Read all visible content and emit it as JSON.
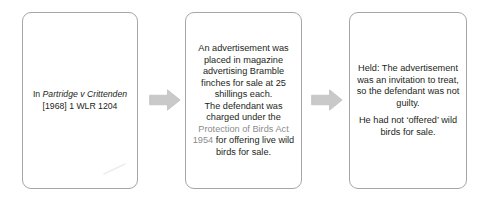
{
  "diagram": {
    "type": "flowchart",
    "orientation": "left-to-right",
    "steps": [
      {
        "id": "citation",
        "name": "case-citation-box",
        "lines": [
          {
            "prefix": "In ",
            "case_name": "Partridge v Crittenden",
            "suffix": ""
          },
          {
            "citation": "[1968] 1 WLR 1204"
          }
        ],
        "text_plain": "In Partridge v Crittenden\n[1968] 1 WLR 1204"
      },
      {
        "id": "facts",
        "name": "case-facts-box",
        "text_before_statute": "An advertisement was placed in magazine advertising Bramble finches for sale at 25 shillings each.\nThe defendant was charged under the ",
        "statute": "Protection of Birds Act 1954",
        "text_after_statute": " for offering live wild birds for sale."
      },
      {
        "id": "held",
        "name": "case-held-box",
        "paragraph_1": "Held: The advertisement was an invitation to treat, so the defendant was not guilty.",
        "paragraph_2": "He had not ‘offered’ wild birds for sale."
      }
    ],
    "connectors": [
      {
        "id": "arrow-1",
        "icon": "right-block-arrow-icon",
        "from": "citation",
        "to": "facts"
      },
      {
        "id": "arrow-2",
        "icon": "right-block-arrow-icon",
        "from": "facts",
        "to": "held"
      }
    ],
    "colors": {
      "background": "#ffffff",
      "box_border": "#a6a6a6",
      "body_text": "#231f20",
      "statute_text": "#8c8c8c",
      "arrow_fill": "#c9c9c9",
      "arrow_stroke": "#bdbdbd"
    }
  }
}
